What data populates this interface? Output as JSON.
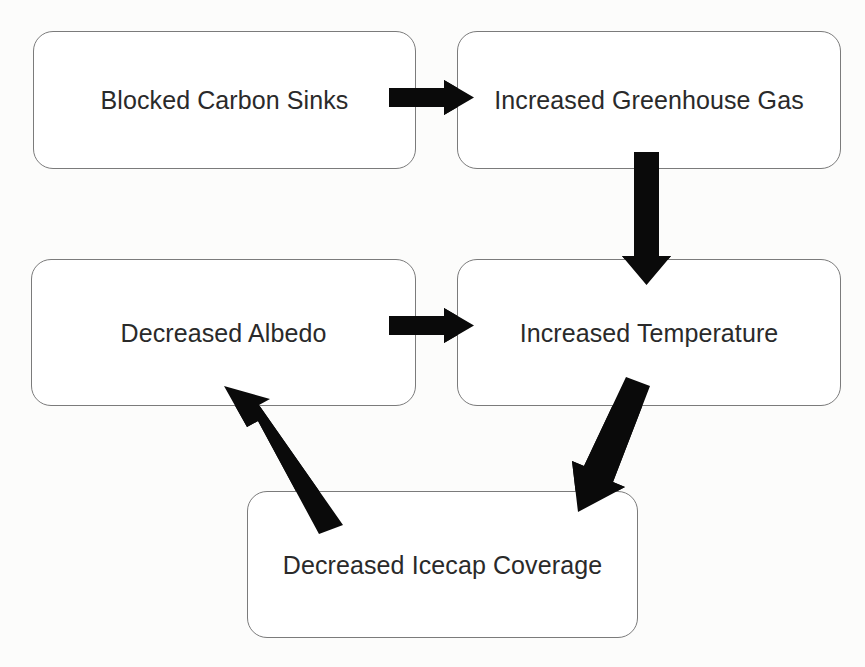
{
  "diagram": {
    "background_color": "#fcfcfb",
    "box_fill_color": "#ffffff",
    "box_border_color": "#7b7b7b",
    "arrow_color": "#0a0a0a",
    "text_color": "#2a2a2a",
    "nodes": [
      {
        "id": "blocked-carbon-sinks",
        "label": "Blocked Carbon Sinks"
      },
      {
        "id": "increased-greenhouse-gas",
        "label": "Increased Greenhouse Gas"
      },
      {
        "id": "decreased-albedo",
        "label": "Decreased Albedo"
      },
      {
        "id": "increased-temperature",
        "label": "Increased Temperature"
      },
      {
        "id": "decreased-icecap-coverage",
        "label": "Decreased Icecap Coverage"
      }
    ],
    "edges": [
      {
        "id": "edge-carbon-to-greenhouse",
        "from": "blocked-carbon-sinks",
        "to": "increased-greenhouse-gas",
        "direction": "right"
      },
      {
        "id": "edge-greenhouse-to-temperature",
        "from": "increased-greenhouse-gas",
        "to": "increased-temperature",
        "direction": "down"
      },
      {
        "id": "edge-temperature-to-icecap",
        "from": "increased-temperature",
        "to": "decreased-icecap-coverage",
        "direction": "down-left-diagonal"
      },
      {
        "id": "edge-icecap-to-albedo",
        "from": "decreased-icecap-coverage",
        "to": "decreased-albedo",
        "direction": "up-left-diagonal"
      },
      {
        "id": "edge-albedo-to-temperature",
        "from": "decreased-albedo",
        "to": "increased-temperature",
        "direction": "right"
      }
    ]
  }
}
